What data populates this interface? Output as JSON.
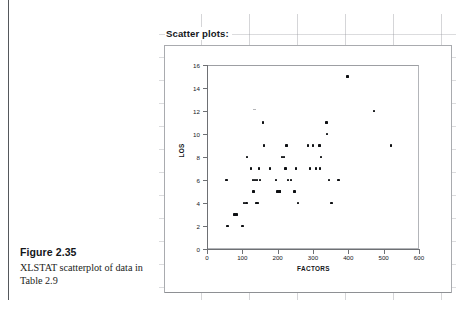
{
  "caption": {
    "figure_number": "Figure 2.35",
    "description": "XLSTAT scatterplot of data in Table 2.9"
  },
  "spreadsheet": {
    "title": "Scatter plots:"
  },
  "chart_data": {
    "type": "scatter",
    "title": "",
    "xlabel": "FACTORS",
    "ylabel": "LOS",
    "xlim": [
      0,
      600
    ],
    "ylim": [
      0,
      16
    ],
    "xticks": [
      0,
      100,
      200,
      300,
      400,
      500,
      600
    ],
    "yticks": [
      0,
      2,
      4,
      6,
      8,
      10,
      12,
      14,
      16
    ],
    "grid": false,
    "legend": false,
    "marker_color": "#0d0f12",
    "points": [
      [
        55,
        6
      ],
      [
        58,
        2
      ],
      [
        78,
        3
      ],
      [
        83,
        3
      ],
      [
        100,
        2
      ],
      [
        105,
        4
      ],
      [
        112,
        4
      ],
      [
        113,
        8
      ],
      [
        125,
        7
      ],
      [
        130,
        6
      ],
      [
        132,
        5
      ],
      [
        136,
        6
      ],
      [
        140,
        4
      ],
      [
        142,
        6
      ],
      [
        145,
        4
      ],
      [
        147,
        7
      ],
      [
        150,
        6
      ],
      [
        158,
        11
      ],
      [
        162,
        9
      ],
      [
        178,
        7
      ],
      [
        196,
        6
      ],
      [
        200,
        5
      ],
      [
        205,
        5
      ],
      [
        207,
        5
      ],
      [
        212,
        8
      ],
      [
        218,
        8
      ],
      [
        222,
        7
      ],
      [
        225,
        9
      ],
      [
        230,
        6
      ],
      [
        238,
        6
      ],
      [
        248,
        5
      ],
      [
        252,
        7
      ],
      [
        258,
        4
      ],
      [
        285,
        9
      ],
      [
        292,
        7
      ],
      [
        300,
        9
      ],
      [
        308,
        7
      ],
      [
        318,
        9
      ],
      [
        320,
        7
      ],
      [
        322,
        8
      ],
      [
        338,
        11
      ],
      [
        340,
        10
      ],
      [
        345,
        6
      ],
      [
        352,
        4
      ],
      [
        372,
        6
      ],
      [
        398,
        15
      ],
      [
        472,
        12
      ],
      [
        520,
        9
      ]
    ]
  }
}
